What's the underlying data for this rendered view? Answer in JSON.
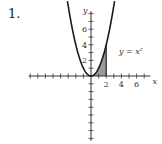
{
  "problem": {
    "number": "1."
  },
  "chart_data": {
    "type": "line",
    "title": "",
    "function": "y = x^2",
    "curve_label": "y = x²",
    "xlabel": "x",
    "ylabel": "y",
    "xlim": [
      -8,
      8
    ],
    "ylim": [
      -8,
      8
    ],
    "x_tick_labels": [
      "2",
      "4",
      "6"
    ],
    "y_tick_labels": [
      "2",
      "4",
      "6"
    ],
    "x_ticks_every": 1,
    "y_ticks_every": 1,
    "grid": false,
    "series": [
      {
        "name": "y = x^2",
        "x": [
          -3,
          -2,
          -1,
          0,
          1,
          2,
          3
        ],
        "values": [
          9,
          4,
          1,
          0,
          1,
          4,
          9
        ]
      }
    ],
    "shaded_region": {
      "description": "area under y = x^2 from x = 0 to x = 2",
      "x_from": 0,
      "x_to": 2,
      "color": "#9a9a9a"
    },
    "colors": {
      "curve": "#1a1a1a",
      "axis": "#333333",
      "shade": "#9a9a9a"
    }
  }
}
